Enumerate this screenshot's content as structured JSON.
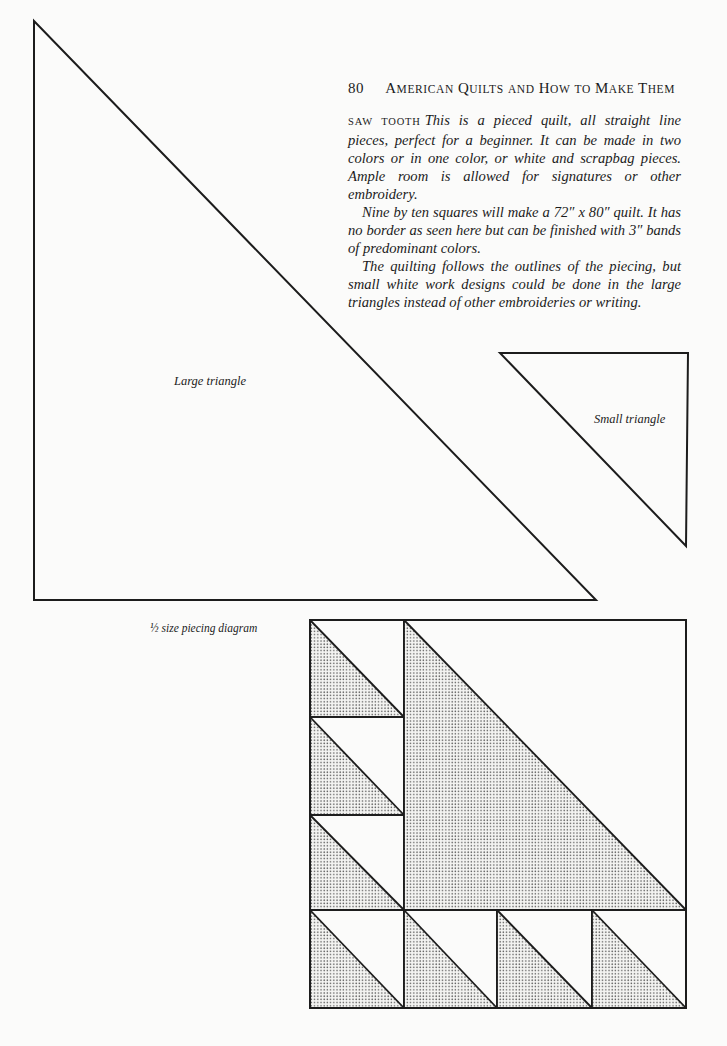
{
  "header": {
    "page_number": "80",
    "title": "American Quilts and How to Make Them",
    "title_parts": [
      {
        "cap": "A",
        "rest": "MERICAN"
      },
      {
        "cap": "Q",
        "rest": "UILTS"
      },
      {
        "cap": "",
        "rest": "AND"
      },
      {
        "cap": "H",
        "rest": "OW"
      },
      {
        "cap": "",
        "rest": "TO"
      },
      {
        "cap": "M",
        "rest": "AKE"
      },
      {
        "cap": "T",
        "rest": "HEM"
      }
    ]
  },
  "article": {
    "pattern_name": "saw tooth",
    "paragraphs": [
      "This is a pieced quilt, all straight line pieces, perfect for a beginner. It can be made in two colors or in one color, or white and scrapbag pieces. Ample room is allowed for signatures or other embroidery.",
      "Nine by ten squares will make a 72″ x 80″ quilt. It has no border as seen here but can be finished with 3″ bands of predominant colors.",
      "The quilting follows the outlines of the piecing, but small white work designs could be done in the large triangles instead of other embroideries or writing."
    ]
  },
  "figures": {
    "large_triangle_label": "Large triangle",
    "small_triangle_label": "Small triangle",
    "piecing_diagram_label": "½ size piecing diagram"
  },
  "colors": {
    "paper": "#fbfbfa",
    "ink": "#1c1c1c",
    "dot_fill": "#555555"
  }
}
